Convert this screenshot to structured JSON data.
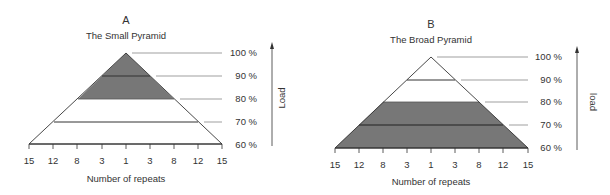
{
  "colors": {
    "fill": "#777777",
    "line": "#333333",
    "guide": "#555555"
  },
  "panels": [
    {
      "letter": "A",
      "title": "The Small Pyramid",
      "axis_label": "Load",
      "xlabel": "Number of repeats",
      "x_ticks": [
        "15",
        "12",
        "8",
        "3",
        "1",
        "3",
        "8",
        "12",
        "15"
      ],
      "levels": [
        "100 %",
        "90 %",
        "80 %",
        "70 %",
        "60 %"
      ],
      "shaded_bands": [
        "100-90 %",
        "90-80 %"
      ]
    },
    {
      "letter": "B",
      "title": "The Broad Pyramid",
      "axis_label": "load",
      "xlabel": "Number of repeats",
      "x_ticks": [
        "15",
        "12",
        "8",
        "3",
        "1",
        "3",
        "8",
        "12",
        "15"
      ],
      "levels": [
        "100 %",
        "90 %",
        "80 %",
        "70 %",
        "60 %"
      ],
      "shaded_bands": [
        "80-70 %",
        "70-60 %"
      ]
    }
  ]
}
